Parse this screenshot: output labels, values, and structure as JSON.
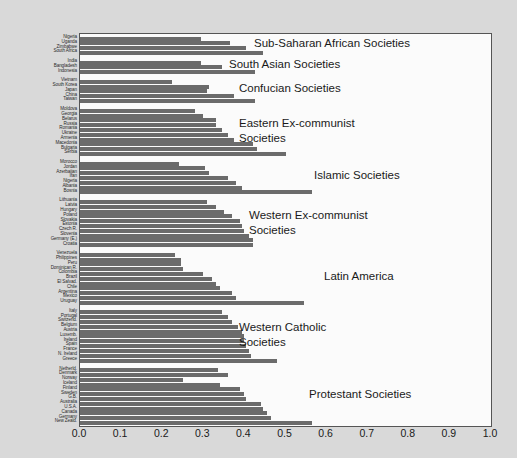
{
  "chart_data": {
    "type": "bar",
    "orientation": "horizontal",
    "title": "",
    "xlabel": "",
    "ylabel": "",
    "xlim": [
      0.0,
      1.0
    ],
    "grid": false,
    "legend": "none",
    "xticks": [
      "0.0",
      "0.1",
      "0.2",
      "0.3",
      "0.4",
      "0.5",
      "0.6",
      "0.7",
      "0.8",
      "0.9",
      "1.0"
    ],
    "xtick_values": [
      0.0,
      0.1,
      0.2,
      0.3,
      0.4,
      0.5,
      0.6,
      0.7,
      0.8,
      0.9,
      1.0
    ],
    "bar_color": "#6b6b6b",
    "panel_color": "#fbfbfb",
    "background_color": "#d9d9d9",
    "groups": [
      {
        "label": "Sub-Saharan African Societies",
        "categories": [
          "Nigeria",
          "Uganda",
          "Zimbabwe",
          "South Africa"
        ],
        "values": [
          0.295,
          0.365,
          0.405,
          0.445
        ]
      },
      {
        "label": "South Asian Societies",
        "categories": [
          "India",
          "Bangladesh",
          "Indonesia"
        ],
        "values": [
          0.295,
          0.345,
          0.425
        ]
      },
      {
        "label": "Confucian Societies",
        "categories": [
          "Vietnam",
          "South Korea",
          "Japan",
          "China",
          "Taiwan"
        ],
        "values": [
          0.225,
          0.315,
          0.31,
          0.375,
          0.425
        ]
      },
      {
        "label": "Eastern Ex-communist Societies",
        "categories": [
          "Moldova",
          "Georgia",
          "Belarus",
          "Russia",
          "Romania",
          "Ukraine",
          "Armenia",
          "Macedonia",
          "Bulgaria",
          "Serbia"
        ],
        "values": [
          0.28,
          0.3,
          0.33,
          0.33,
          0.345,
          0.36,
          0.375,
          0.42,
          0.43,
          0.5
        ]
      },
      {
        "label": "Islamic Societies",
        "categories": [
          "Morocco",
          "Jordan",
          "Azerbaijan",
          "Iran",
          "Nigeria",
          "Albania",
          "Bosnia"
        ],
        "values": [
          0.24,
          0.305,
          0.315,
          0.36,
          0.38,
          0.395,
          0.565
        ]
      },
      {
        "label": "Western Ex-communist Societies",
        "categories": [
          "Lithuania",
          "Latvia",
          "Hungary",
          "Poland",
          "Slovakia",
          "Estonia",
          "Czech R.",
          "Slovenia",
          "Germany (E.)",
          "Croatia"
        ],
        "values": [
          0.31,
          0.33,
          0.35,
          0.37,
          0.39,
          0.395,
          0.4,
          0.41,
          0.42,
          0.42
        ]
      },
      {
        "label": "Latin America",
        "categories": [
          "Venezuela",
          "Philippines",
          "Peru",
          "Dominican R.",
          "Colombia",
          "Brazil",
          "El Salvad.",
          "Chile",
          "Argentina",
          "Mexico",
          "Uruguay"
        ],
        "values": [
          0.23,
          0.245,
          0.245,
          0.25,
          0.3,
          0.32,
          0.33,
          0.34,
          0.37,
          0.38,
          0.545
        ]
      },
      {
        "label": "Western Catholic Societies",
        "categories": [
          "Italy",
          "Portugal",
          "Switzerld.",
          "Belgium",
          "Austria",
          "Luxemb.",
          "Ireland",
          "Spain",
          "France",
          "N. Ireland",
          "Greece"
        ],
        "values": [
          0.345,
          0.36,
          0.37,
          0.385,
          0.395,
          0.4,
          0.4,
          0.405,
          0.41,
          0.415,
          0.48
        ]
      },
      {
        "label": "Protestant Societies",
        "categories": [
          "Netherld.",
          "Denmark",
          "Norway",
          "Iceland",
          "Finland",
          "Sweden",
          "G.B.",
          "Australia",
          "U.S.A.",
          "Canada",
          "Germany",
          "New Zeald."
        ],
        "values": [
          0.335,
          0.36,
          0.25,
          0.34,
          0.39,
          0.4,
          0.405,
          0.44,
          0.445,
          0.455,
          0.465,
          0.565
        ]
      }
    ]
  }
}
